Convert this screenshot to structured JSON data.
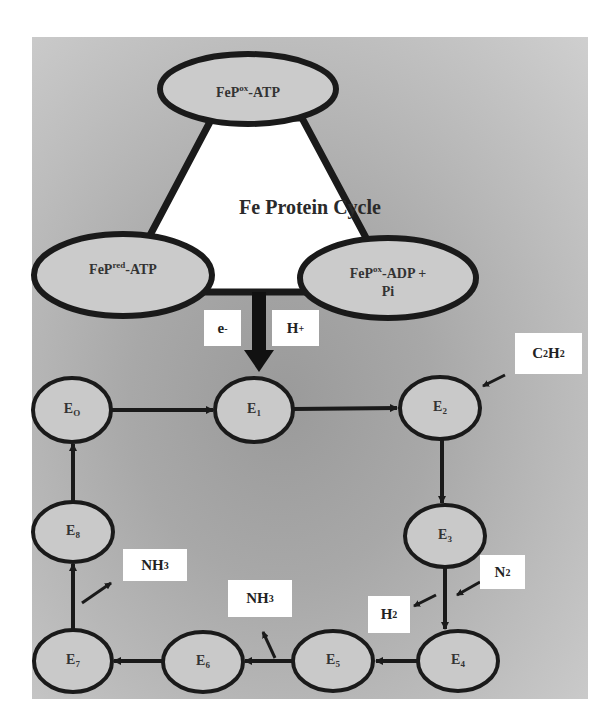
{
  "diagram": {
    "title": "Fe Protein Cycle",
    "fe_protein_states": [
      {
        "id": "top",
        "base": "FeP",
        "sup": "ox",
        "suffix": "-ATP"
      },
      {
        "id": "left",
        "base": "FeP",
        "sup": "red",
        "suffix": "-ATP"
      },
      {
        "id": "right",
        "base": "FeP",
        "sup": "ox",
        "suffix": "-ADP +",
        "line2": "Pi"
      }
    ],
    "transfer_labels": {
      "electron": {
        "base": "e",
        "sup": "-"
      },
      "proton": {
        "base": "H",
        "sup": "+"
      }
    },
    "mofe_states": [
      {
        "id": "E0",
        "base": "E",
        "sub": "O"
      },
      {
        "id": "E1",
        "base": "E",
        "sub": "1"
      },
      {
        "id": "E2",
        "base": "E",
        "sub": "2"
      },
      {
        "id": "E3",
        "base": "E",
        "sub": "3"
      },
      {
        "id": "E4",
        "base": "E",
        "sub": "4"
      },
      {
        "id": "E5",
        "base": "E",
        "sub": "5"
      },
      {
        "id": "E6",
        "base": "E",
        "sub": "6"
      },
      {
        "id": "E7",
        "base": "E",
        "sub": "7"
      },
      {
        "id": "E8",
        "base": "E",
        "sub": "8"
      }
    ],
    "substrates": {
      "c2h2": {
        "p1": "C",
        "s1": "2",
        "p2": "H",
        "s2": "2",
        "direction": "in",
        "at": "E2"
      },
      "n2": {
        "p1": "N",
        "s1": "2",
        "direction": "in",
        "at": "E3-E4"
      },
      "h2": {
        "p1": "H",
        "s1": "2",
        "direction": "out",
        "at": "E3-E4"
      },
      "nh3_a": {
        "p1": "NH",
        "s1": "3",
        "direction": "out",
        "at": "E5-E6"
      },
      "nh3_b": {
        "p1": "NH",
        "s1": "3",
        "direction": "out",
        "at": "E7-E8"
      }
    },
    "flow": [
      "E0",
      "E1",
      "E2",
      "E3",
      "E4",
      "E5",
      "E6",
      "E7",
      "E8",
      "E0"
    ],
    "colors": {
      "stroke": "#1a1a1a",
      "node_fill": "#cfcfcf",
      "triangle_fill": "#ffffff",
      "label_box": "#ffffff"
    }
  }
}
